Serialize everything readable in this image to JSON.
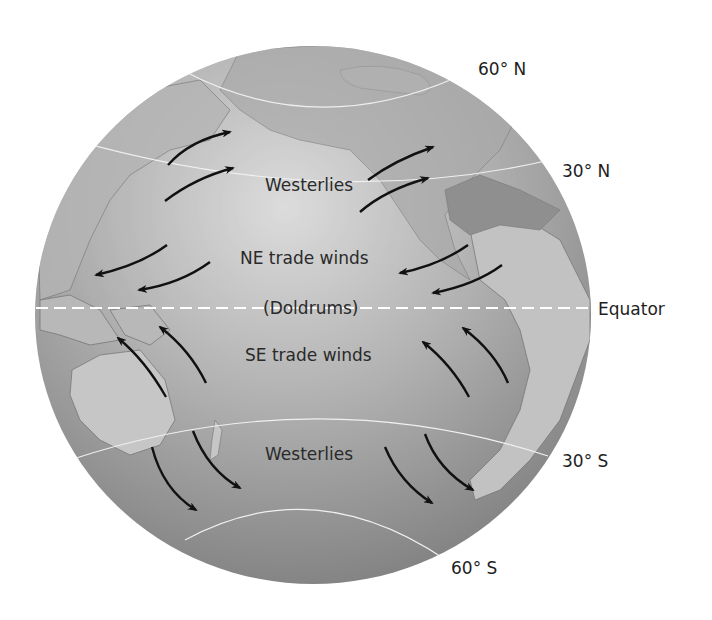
{
  "diagram": {
    "type": "global wind belts on a globe",
    "wind_labels": {
      "westerlies_north": "Westerlies",
      "ne_trades": "NE trade winds",
      "doldrums": "(Doldrums)",
      "se_trades": "SE trade winds",
      "westerlies_south": "Westerlies"
    },
    "latitude_labels": {
      "lat_60n": "60° N",
      "lat_30n": "30° N",
      "equator": "Equator",
      "lat_30s": "30° S",
      "lat_60s": "60° S"
    },
    "colors": {
      "ocean_light": "#d6d6d6",
      "ocean_dark": "#8a8a8a",
      "land": "#b9b9b9",
      "land_dark": "#7a7a7a",
      "arrow": "#111111",
      "latitude_line": "#f2f2f2",
      "equator_dash": "#ffffff"
    }
  }
}
